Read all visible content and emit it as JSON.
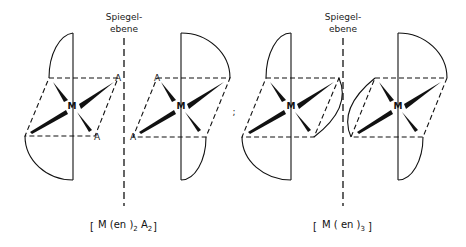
{
  "figure": {
    "mirror_label_line1": "Spiegel-",
    "mirror_label_line2": "ebene",
    "metal_symbol": "M",
    "ligand_symbol": "A",
    "separator": ";",
    "formula_left": {
      "open": "[",
      "main": "M (en )",
      "sub1": "2",
      "mid": " A",
      "sub2": "2",
      "close": "]"
    },
    "formula_right": {
      "open": "[",
      "main": "M ( en )",
      "sub1": "3",
      "close": "]"
    }
  },
  "colors": {
    "ink": "#111111",
    "background": "#ffffff"
  }
}
